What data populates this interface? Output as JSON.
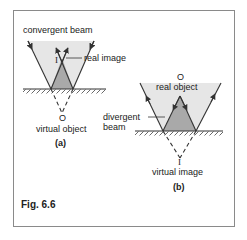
{
  "figure": {
    "caption": "Fig. 6.6",
    "panel_a": {
      "label": "(a)",
      "beam_label": "convergent beam",
      "image_label": "real image",
      "image_symbol": "I",
      "object_symbol": "O",
      "object_label": "virtual object"
    },
    "panel_b": {
      "label": "(b)",
      "beam_label_line1": "divergent",
      "beam_label_line2": "beam",
      "object_symbol": "O",
      "object_label": "real object",
      "image_symbol": "I",
      "image_label": "virtual image"
    },
    "colors": {
      "shade_light": "#e6e6e6",
      "shade_dark": "#a9a9a9",
      "line": "#333333",
      "border": "#8a8a8a"
    }
  }
}
